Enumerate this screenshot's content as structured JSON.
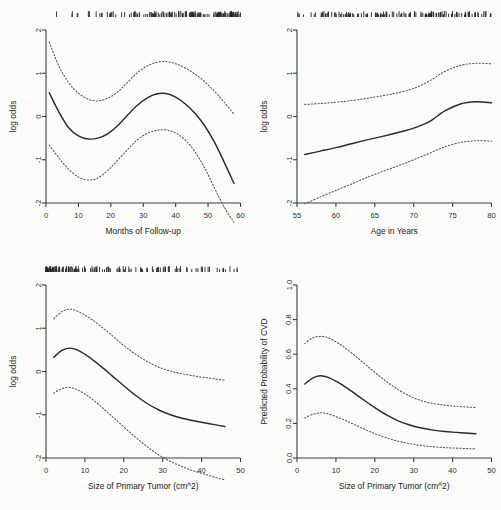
{
  "figure": {
    "name": "four-panel-spline-regression-figure",
    "background": "#fbfbf9",
    "line_color": "#2b2b2b",
    "ci_color": "#555555",
    "layout": "2x2"
  },
  "chart_data": [
    {
      "id": "panel-follow-up",
      "type": "line",
      "position": "top-left",
      "title": "",
      "xlabel": "Months of Follow-up",
      "ylabel": "log odds",
      "xlim": [
        0,
        60
      ],
      "ylim": [
        -2,
        2
      ],
      "xticks": [
        0,
        10,
        20,
        30,
        40,
        50,
        60
      ],
      "xticklabels": [
        "0",
        "10",
        "20",
        "30",
        "40",
        "50",
        "60"
      ],
      "yticks": [
        -2,
        -1,
        0,
        1,
        2
      ],
      "yticklabels": [
        "-2",
        "-1",
        "0",
        "1",
        "2"
      ],
      "grid": false,
      "legend": "none",
      "rug": true,
      "series": [
        {
          "name": "fit",
          "style": "solid",
          "x": [
            1,
            4,
            7,
            10,
            13,
            16,
            19,
            22,
            25,
            28,
            31,
            34,
            37,
            40,
            43,
            46,
            49,
            52,
            55,
            58
          ],
          "y": [
            0.55,
            0.1,
            -0.26,
            -0.45,
            -0.52,
            -0.5,
            -0.4,
            -0.22,
            0.02,
            0.25,
            0.42,
            0.52,
            0.53,
            0.45,
            0.29,
            0.07,
            -0.22,
            -0.6,
            -1.06,
            -1.55
          ]
        },
        {
          "name": "upper-ci",
          "style": "dotted",
          "x": [
            1,
            4,
            7,
            10,
            13,
            16,
            19,
            22,
            25,
            28,
            31,
            34,
            37,
            40,
            43,
            46,
            49,
            52,
            55,
            58
          ],
          "y": [
            1.72,
            1.16,
            0.78,
            0.54,
            0.4,
            0.36,
            0.42,
            0.56,
            0.78,
            1.0,
            1.16,
            1.25,
            1.27,
            1.22,
            1.12,
            0.98,
            0.8,
            0.58,
            0.33,
            0.05
          ]
        },
        {
          "name": "lower-ci",
          "style": "dotted",
          "x": [
            1,
            4,
            7,
            10,
            13,
            16,
            19,
            22,
            25,
            28,
            31,
            34,
            37,
            40,
            43,
            46,
            49,
            52,
            55,
            58
          ],
          "y": [
            -0.66,
            -0.96,
            -1.22,
            -1.4,
            -1.47,
            -1.42,
            -1.25,
            -1.02,
            -0.78,
            -0.55,
            -0.4,
            -0.32,
            -0.31,
            -0.38,
            -0.55,
            -0.82,
            -1.2,
            -1.66,
            -2.1,
            -2.45
          ]
        }
      ]
    },
    {
      "id": "panel-age",
      "type": "line",
      "position": "top-right",
      "title": "",
      "xlabel": "Age in Years",
      "ylabel": "log odds",
      "xlim": [
        55,
        80
      ],
      "ylim": [
        -2,
        2
      ],
      "xticks": [
        55,
        60,
        65,
        70,
        75,
        80
      ],
      "xticklabels": [
        "55",
        "60",
        "65",
        "70",
        "75",
        "80"
      ],
      "yticks": [
        -2,
        -1,
        0,
        1,
        2
      ],
      "yticklabels": [
        "-2",
        "-1",
        "0",
        "1",
        "2"
      ],
      "grid": false,
      "legend": "none",
      "rug": true,
      "series": [
        {
          "name": "fit",
          "style": "solid",
          "x": [
            56,
            58,
            60,
            62,
            64,
            66,
            68,
            70,
            72,
            74,
            76,
            78,
            80
          ],
          "y": [
            -0.88,
            -0.8,
            -0.72,
            -0.63,
            -0.54,
            -0.46,
            -0.37,
            -0.27,
            -0.12,
            0.13,
            0.29,
            0.34,
            0.32
          ]
        },
        {
          "name": "upper-ci",
          "style": "dotted",
          "x": [
            56,
            58,
            60,
            62,
            64,
            66,
            68,
            70,
            72,
            74,
            76,
            78,
            80
          ],
          "y": [
            0.28,
            0.3,
            0.33,
            0.37,
            0.42,
            0.48,
            0.55,
            0.65,
            0.82,
            1.04,
            1.18,
            1.23,
            1.22
          ]
        },
        {
          "name": "lower-ci",
          "style": "dotted",
          "x": [
            56,
            58,
            60,
            62,
            64,
            66,
            68,
            70,
            72,
            74,
            76,
            78,
            80
          ],
          "y": [
            -2.02,
            -1.86,
            -1.71,
            -1.56,
            -1.41,
            -1.27,
            -1.14,
            -1.0,
            -0.85,
            -0.7,
            -0.6,
            -0.56,
            -0.57
          ]
        }
      ]
    },
    {
      "id": "panel-tumor-logodds",
      "type": "line",
      "position": "bottom-left",
      "title": "",
      "xlabel": "Size of Primary Tumor (cm^2)",
      "ylabel": "log odds",
      "xlim": [
        0,
        50
      ],
      "ylim": [
        -2,
        2
      ],
      "xticks": [
        0,
        10,
        20,
        30,
        40,
        50
      ],
      "xticklabels": [
        "0",
        "10",
        "20",
        "30",
        "40",
        "50"
      ],
      "yticks": [
        -2,
        -1,
        0,
        1,
        2
      ],
      "yticklabels": [
        "-2",
        "-1",
        "0",
        "1",
        "2"
      ],
      "grid": false,
      "legend": "none",
      "rug": true,
      "series": [
        {
          "name": "fit",
          "style": "solid",
          "x": [
            2,
            4,
            6,
            8,
            11,
            14,
            17,
            20,
            23,
            26,
            29,
            32,
            35,
            38,
            41,
            44,
            46
          ],
          "y": [
            0.33,
            0.48,
            0.54,
            0.5,
            0.34,
            0.13,
            -0.1,
            -0.33,
            -0.55,
            -0.74,
            -0.89,
            -1.0,
            -1.08,
            -1.14,
            -1.19,
            -1.24,
            -1.27
          ]
        },
        {
          "name": "upper-ci",
          "style": "dotted",
          "x": [
            2,
            4,
            6,
            8,
            11,
            14,
            17,
            20,
            23,
            26,
            29,
            32,
            35,
            38,
            41,
            44,
            46
          ],
          "y": [
            1.22,
            1.38,
            1.44,
            1.4,
            1.25,
            1.05,
            0.83,
            0.6,
            0.4,
            0.23,
            0.1,
            0.01,
            -0.05,
            -0.1,
            -0.14,
            -0.18,
            -0.2
          ]
        },
        {
          "name": "lower-ci",
          "style": "dotted",
          "x": [
            2,
            4,
            6,
            8,
            11,
            14,
            17,
            20,
            23,
            26,
            29,
            32,
            35,
            38,
            41,
            44,
            46
          ],
          "y": [
            -0.5,
            -0.4,
            -0.37,
            -0.42,
            -0.58,
            -0.8,
            -1.04,
            -1.28,
            -1.52,
            -1.74,
            -1.93,
            -2.08,
            -2.2,
            -2.3,
            -2.38,
            -2.46,
            -2.5
          ]
        }
      ]
    },
    {
      "id": "panel-tumor-probability",
      "type": "line",
      "position": "bottom-right",
      "title": "",
      "xlabel": "Size of Primary Tumor (cm^2)",
      "ylabel": "Predicted Probability of CVD",
      "xlim": [
        0,
        50
      ],
      "ylim": [
        0.0,
        1.0
      ],
      "xticks": [
        0,
        10,
        20,
        30,
        40,
        50
      ],
      "xticklabels": [
        "0",
        "10",
        "20",
        "30",
        "40",
        "50"
      ],
      "yticks": [
        0.0,
        0.2,
        0.4,
        0.6,
        0.8,
        1.0
      ],
      "yticklabels": [
        "0.0",
        "0.2",
        "0.4",
        "0.6",
        "0.8",
        "1.0"
      ],
      "grid": false,
      "legend": "none",
      "rug": false,
      "series": [
        {
          "name": "fit",
          "style": "solid",
          "x": [
            2,
            4,
            6,
            8,
            11,
            14,
            17,
            20,
            23,
            26,
            29,
            32,
            35,
            38,
            41,
            44,
            46
          ],
          "y": [
            0.428,
            0.462,
            0.475,
            0.466,
            0.431,
            0.386,
            0.338,
            0.291,
            0.249,
            0.215,
            0.191,
            0.173,
            0.161,
            0.153,
            0.148,
            0.143,
            0.14
          ]
        },
        {
          "name": "upper-ci",
          "style": "dotted",
          "x": [
            2,
            4,
            6,
            8,
            11,
            14,
            17,
            20,
            23,
            26,
            29,
            32,
            35,
            38,
            41,
            44,
            46
          ],
          "y": [
            0.661,
            0.694,
            0.703,
            0.695,
            0.658,
            0.608,
            0.552,
            0.495,
            0.442,
            0.395,
            0.358,
            0.331,
            0.315,
            0.305,
            0.299,
            0.294,
            0.292
          ]
        },
        {
          "name": "lower-ci",
          "style": "dotted",
          "x": [
            2,
            4,
            6,
            8,
            11,
            14,
            17,
            20,
            23,
            26,
            29,
            32,
            35,
            38,
            41,
            44,
            46
          ],
          "y": [
            0.232,
            0.252,
            0.261,
            0.255,
            0.231,
            0.201,
            0.17,
            0.141,
            0.117,
            0.097,
            0.083,
            0.072,
            0.065,
            0.06,
            0.057,
            0.054,
            0.053
          ]
        }
      ]
    }
  ]
}
